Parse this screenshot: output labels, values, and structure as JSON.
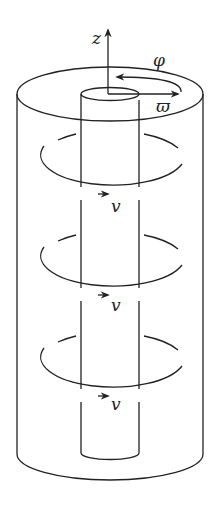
{
  "figure": {
    "axis_labels": {
      "z": "z",
      "phi": "φ",
      "varpi": "ϖ"
    },
    "velocity_labels": [
      "v",
      "v",
      "v"
    ],
    "colors": {
      "stroke": "#222222",
      "background": "#ffffff"
    }
  }
}
